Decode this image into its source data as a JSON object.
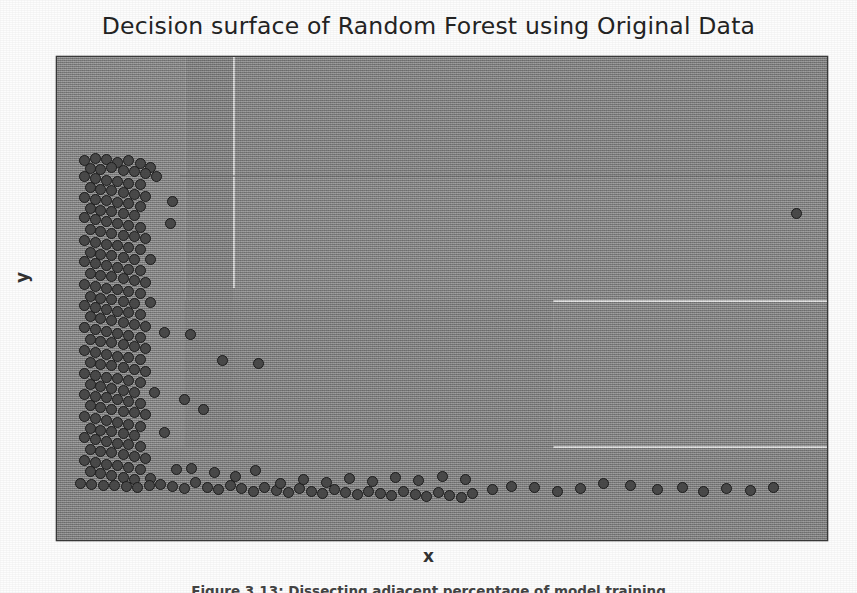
{
  "figure": {
    "title": "Decision surface of Random Forest using Original Data",
    "xlabel": "x",
    "ylabel": "y",
    "caption": "Figure 3.13: Dissecting adjacent percentage of model training"
  },
  "colors": {
    "background": "#888888",
    "region_light": "#8b8b8b",
    "region_dark": "#848484",
    "boundary_line": "#dcdcdc",
    "marker_fill": "#4a4a4a",
    "marker_edge": "#1d1d1d",
    "axes_frame": "#333333",
    "text": "#242424"
  },
  "chart_data": {
    "type": "scatter",
    "title": "Decision surface of Random Forest using Original Data",
    "xlabel": "x",
    "ylabel": "y",
    "grid": false,
    "legend": "none",
    "xlim": [
      0,
      1
    ],
    "ylim": [
      0,
      1
    ],
    "xticks": [],
    "yticks": [],
    "annotations": [
      "Dense vertical cluster of points hugging the left axis from y=0.12 to y=0.80",
      "Dense horizontal cluster of points hugging the bottom axis from x=0.01 to x=0.55",
      "One isolated outlier near the upper right at approximately (0.96, 0.68)"
    ],
    "boundaries": [
      {
        "orientation": "vertical",
        "x": 0.155,
        "y_from": 0.52,
        "y_to": 1.0,
        "shade": "light"
      },
      {
        "orientation": "vertical",
        "x": 0.093,
        "y_from": 0.5,
        "y_to": 1.0,
        "shade": "faint"
      },
      {
        "orientation": "horizontal",
        "y": 0.755,
        "x_from": 0.086,
        "x_to": 1.0,
        "shade": "dark"
      },
      {
        "orientation": "horizontal",
        "y": 0.497,
        "x_from": 0.644,
        "x_to": 1.0,
        "shade": "light"
      },
      {
        "orientation": "horizontal",
        "y": 0.195,
        "x_from": 0.644,
        "x_to": 1.0,
        "shade": "light"
      },
      {
        "orientation": "horizontal",
        "y": 0.195,
        "x_from": 0.093,
        "x_to": 0.644,
        "shade": "faint"
      }
    ],
    "points": [
      [
        0.036,
        0.785
      ],
      [
        0.05,
        0.79
      ],
      [
        0.064,
        0.788
      ],
      [
        0.079,
        0.782
      ],
      [
        0.093,
        0.786
      ],
      [
        0.108,
        0.78
      ],
      [
        0.122,
        0.772
      ],
      [
        0.043,
        0.77
      ],
      [
        0.057,
        0.768
      ],
      [
        0.071,
        0.772
      ],
      [
        0.086,
        0.766
      ],
      [
        0.1,
        0.762
      ],
      [
        0.115,
        0.758
      ],
      [
        0.129,
        0.752
      ],
      [
        0.036,
        0.752
      ],
      [
        0.05,
        0.748
      ],
      [
        0.064,
        0.745
      ],
      [
        0.079,
        0.742
      ],
      [
        0.093,
        0.738
      ],
      [
        0.108,
        0.735
      ],
      [
        0.043,
        0.73
      ],
      [
        0.057,
        0.726
      ],
      [
        0.071,
        0.724
      ],
      [
        0.086,
        0.72
      ],
      [
        0.1,
        0.716
      ],
      [
        0.115,
        0.712
      ],
      [
        0.036,
        0.71
      ],
      [
        0.05,
        0.706
      ],
      [
        0.064,
        0.702
      ],
      [
        0.079,
        0.698
      ],
      [
        0.093,
        0.696
      ],
      [
        0.108,
        0.69
      ],
      [
        0.043,
        0.686
      ],
      [
        0.057,
        0.682
      ],
      [
        0.071,
        0.68
      ],
      [
        0.086,
        0.676
      ],
      [
        0.1,
        0.672
      ],
      [
        0.036,
        0.668
      ],
      [
        0.05,
        0.664
      ],
      [
        0.064,
        0.66
      ],
      [
        0.079,
        0.656
      ],
      [
        0.093,
        0.652
      ],
      [
        0.108,
        0.648
      ],
      [
        0.15,
        0.7
      ],
      [
        0.148,
        0.656
      ],
      [
        0.043,
        0.642
      ],
      [
        0.057,
        0.638
      ],
      [
        0.071,
        0.635
      ],
      [
        0.086,
        0.631
      ],
      [
        0.1,
        0.628
      ],
      [
        0.115,
        0.624
      ],
      [
        0.036,
        0.62
      ],
      [
        0.05,
        0.616
      ],
      [
        0.064,
        0.612
      ],
      [
        0.079,
        0.609
      ],
      [
        0.093,
        0.605
      ],
      [
        0.108,
        0.601
      ],
      [
        0.043,
        0.596
      ],
      [
        0.057,
        0.592
      ],
      [
        0.071,
        0.589
      ],
      [
        0.086,
        0.585
      ],
      [
        0.1,
        0.581
      ],
      [
        0.122,
        0.58
      ],
      [
        0.036,
        0.576
      ],
      [
        0.05,
        0.572
      ],
      [
        0.064,
        0.569
      ],
      [
        0.079,
        0.565
      ],
      [
        0.093,
        0.561
      ],
      [
        0.108,
        0.557
      ],
      [
        0.043,
        0.552
      ],
      [
        0.057,
        0.548
      ],
      [
        0.071,
        0.545
      ],
      [
        0.086,
        0.541
      ],
      [
        0.1,
        0.537
      ],
      [
        0.115,
        0.533
      ],
      [
        0.036,
        0.529
      ],
      [
        0.05,
        0.525
      ],
      [
        0.064,
        0.521
      ],
      [
        0.079,
        0.518
      ],
      [
        0.093,
        0.514
      ],
      [
        0.108,
        0.51
      ],
      [
        0.043,
        0.505
      ],
      [
        0.057,
        0.501
      ],
      [
        0.071,
        0.498
      ],
      [
        0.086,
        0.494
      ],
      [
        0.1,
        0.49
      ],
      [
        0.122,
        0.492
      ],
      [
        0.036,
        0.486
      ],
      [
        0.05,
        0.482
      ],
      [
        0.064,
        0.478
      ],
      [
        0.079,
        0.474
      ],
      [
        0.093,
        0.47
      ],
      [
        0.108,
        0.466
      ],
      [
        0.043,
        0.462
      ],
      [
        0.057,
        0.458
      ],
      [
        0.071,
        0.455
      ],
      [
        0.086,
        0.451
      ],
      [
        0.1,
        0.447
      ],
      [
        0.115,
        0.443
      ],
      [
        0.036,
        0.439
      ],
      [
        0.05,
        0.435
      ],
      [
        0.064,
        0.431
      ],
      [
        0.079,
        0.427
      ],
      [
        0.093,
        0.424
      ],
      [
        0.108,
        0.42
      ],
      [
        0.14,
        0.43
      ],
      [
        0.173,
        0.425
      ],
      [
        0.043,
        0.415
      ],
      [
        0.057,
        0.411
      ],
      [
        0.071,
        0.408
      ],
      [
        0.086,
        0.404
      ],
      [
        0.1,
        0.4
      ],
      [
        0.115,
        0.396
      ],
      [
        0.036,
        0.392
      ],
      [
        0.05,
        0.388
      ],
      [
        0.064,
        0.384
      ],
      [
        0.079,
        0.38
      ],
      [
        0.093,
        0.377
      ],
      [
        0.108,
        0.373
      ],
      [
        0.215,
        0.372
      ],
      [
        0.262,
        0.365
      ],
      [
        0.043,
        0.368
      ],
      [
        0.057,
        0.364
      ],
      [
        0.071,
        0.361
      ],
      [
        0.086,
        0.357
      ],
      [
        0.1,
        0.353
      ],
      [
        0.115,
        0.349
      ],
      [
        0.036,
        0.345
      ],
      [
        0.05,
        0.341
      ],
      [
        0.064,
        0.337
      ],
      [
        0.079,
        0.334
      ],
      [
        0.093,
        0.33
      ],
      [
        0.108,
        0.326
      ],
      [
        0.043,
        0.321
      ],
      [
        0.057,
        0.317
      ],
      [
        0.071,
        0.314
      ],
      [
        0.086,
        0.31
      ],
      [
        0.1,
        0.306
      ],
      [
        0.126,
        0.305
      ],
      [
        0.036,
        0.302
      ],
      [
        0.05,
        0.298
      ],
      [
        0.064,
        0.294
      ],
      [
        0.079,
        0.29
      ],
      [
        0.093,
        0.287
      ],
      [
        0.108,
        0.283
      ],
      [
        0.165,
        0.29
      ],
      [
        0.19,
        0.27
      ],
      [
        0.043,
        0.278
      ],
      [
        0.057,
        0.274
      ],
      [
        0.071,
        0.271
      ],
      [
        0.086,
        0.267
      ],
      [
        0.1,
        0.263
      ],
      [
        0.115,
        0.259
      ],
      [
        0.036,
        0.255
      ],
      [
        0.05,
        0.251
      ],
      [
        0.064,
        0.247
      ],
      [
        0.079,
        0.244
      ],
      [
        0.093,
        0.24
      ],
      [
        0.108,
        0.236
      ],
      [
        0.043,
        0.231
      ],
      [
        0.057,
        0.227
      ],
      [
        0.071,
        0.224
      ],
      [
        0.086,
        0.22
      ],
      [
        0.1,
        0.216
      ],
      [
        0.14,
        0.222
      ],
      [
        0.036,
        0.212
      ],
      [
        0.05,
        0.208
      ],
      [
        0.064,
        0.204
      ],
      [
        0.079,
        0.2
      ],
      [
        0.093,
        0.197
      ],
      [
        0.108,
        0.193
      ],
      [
        0.043,
        0.188
      ],
      [
        0.057,
        0.184
      ],
      [
        0.071,
        0.181
      ],
      [
        0.086,
        0.177
      ],
      [
        0.1,
        0.173
      ],
      [
        0.115,
        0.169
      ],
      [
        0.036,
        0.165
      ],
      [
        0.05,
        0.161
      ],
      [
        0.064,
        0.157
      ],
      [
        0.079,
        0.154
      ],
      [
        0.093,
        0.15
      ],
      [
        0.108,
        0.146
      ],
      [
        0.043,
        0.141
      ],
      [
        0.057,
        0.137
      ],
      [
        0.071,
        0.134
      ],
      [
        0.086,
        0.13
      ],
      [
        0.1,
        0.126
      ],
      [
        0.122,
        0.128
      ],
      [
        0.03,
        0.118
      ],
      [
        0.045,
        0.115
      ],
      [
        0.06,
        0.113
      ],
      [
        0.075,
        0.112
      ],
      [
        0.09,
        0.11
      ],
      [
        0.105,
        0.108
      ],
      [
        0.12,
        0.112
      ],
      [
        0.135,
        0.115
      ],
      [
        0.15,
        0.11
      ],
      [
        0.165,
        0.106
      ],
      [
        0.18,
        0.12
      ],
      [
        0.195,
        0.108
      ],
      [
        0.21,
        0.104
      ],
      [
        0.225,
        0.113
      ],
      [
        0.24,
        0.106
      ],
      [
        0.255,
        0.1
      ],
      [
        0.27,
        0.109
      ],
      [
        0.285,
        0.102
      ],
      [
        0.3,
        0.098
      ],
      [
        0.315,
        0.106
      ],
      [
        0.33,
        0.1
      ],
      [
        0.345,
        0.096
      ],
      [
        0.36,
        0.104
      ],
      [
        0.375,
        0.098
      ],
      [
        0.39,
        0.094
      ],
      [
        0.405,
        0.1
      ],
      [
        0.42,
        0.096
      ],
      [
        0.435,
        0.092
      ],
      [
        0.45,
        0.1
      ],
      [
        0.465,
        0.094
      ],
      [
        0.48,
        0.09
      ],
      [
        0.495,
        0.098
      ],
      [
        0.51,
        0.093
      ],
      [
        0.525,
        0.089
      ],
      [
        0.54,
        0.097
      ],
      [
        0.155,
        0.145
      ],
      [
        0.175,
        0.148
      ],
      [
        0.205,
        0.14
      ],
      [
        0.232,
        0.132
      ],
      [
        0.258,
        0.144
      ],
      [
        0.29,
        0.118
      ],
      [
        0.32,
        0.126
      ],
      [
        0.35,
        0.12
      ],
      [
        0.38,
        0.128
      ],
      [
        0.41,
        0.122
      ],
      [
        0.44,
        0.13
      ],
      [
        0.47,
        0.124
      ],
      [
        0.5,
        0.132
      ],
      [
        0.53,
        0.126
      ],
      [
        0.565,
        0.104
      ],
      [
        0.59,
        0.11
      ],
      [
        0.62,
        0.108
      ],
      [
        0.65,
        0.1
      ],
      [
        0.68,
        0.106
      ],
      [
        0.71,
        0.118
      ],
      [
        0.745,
        0.112
      ],
      [
        0.78,
        0.104
      ],
      [
        0.812,
        0.108
      ],
      [
        0.84,
        0.1
      ],
      [
        0.87,
        0.106
      ],
      [
        0.9,
        0.102
      ],
      [
        0.93,
        0.108
      ],
      [
        0.961,
        0.675
      ]
    ]
  }
}
